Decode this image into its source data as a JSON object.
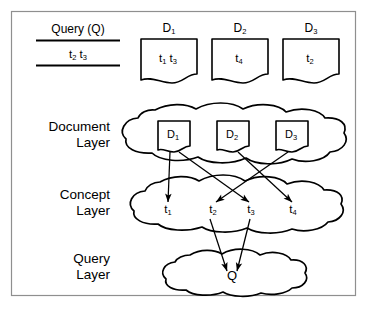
{
  "figure": {
    "border_color": "#8f8f8f",
    "ink_color": "#000000",
    "background": "#ffffff"
  },
  "query_box": {
    "title": "Query (Q)",
    "terms": "t2 t3",
    "term_list": [
      "t2",
      "t3"
    ]
  },
  "documents": [
    {
      "id": "D1",
      "caption_base": "D",
      "caption_sub": "1",
      "terms_display": "t1 t3",
      "terms": [
        "t1",
        "t3"
      ]
    },
    {
      "id": "D2",
      "caption_base": "D",
      "caption_sub": "2",
      "terms_display": "t4",
      "terms": [
        "t4"
      ]
    },
    {
      "id": "D3",
      "caption_base": "D",
      "caption_sub": "3",
      "terms_display": "t2",
      "terms": [
        "t2"
      ]
    }
  ],
  "layers": [
    {
      "key": "document",
      "line1": "Document",
      "line2": "Layer"
    },
    {
      "key": "concept",
      "line1": "Concept",
      "line2": "Layer"
    },
    {
      "key": "query",
      "line1": "Query",
      "line2": "Layer"
    }
  ],
  "document_layer_nodes": [
    {
      "base": "D",
      "sub": "1"
    },
    {
      "base": "D",
      "sub": "2"
    },
    {
      "base": "D",
      "sub": "3"
    }
  ],
  "concept_layer_nodes": [
    {
      "base": "t",
      "sub": "1"
    },
    {
      "base": "t",
      "sub": "2"
    },
    {
      "base": "t",
      "sub": "3"
    },
    {
      "base": "t",
      "sub": "4"
    }
  ],
  "query_layer_nodes": [
    {
      "base": "Q",
      "sub": ""
    }
  ],
  "edges": [
    {
      "from": "D1",
      "to": "t1"
    },
    {
      "from": "D1",
      "to": "t3"
    },
    {
      "from": "D2",
      "to": "t4"
    },
    {
      "from": "D3",
      "to": "t2"
    },
    {
      "from": "t2",
      "to": "Q"
    },
    {
      "from": "t3",
      "to": "Q"
    }
  ]
}
